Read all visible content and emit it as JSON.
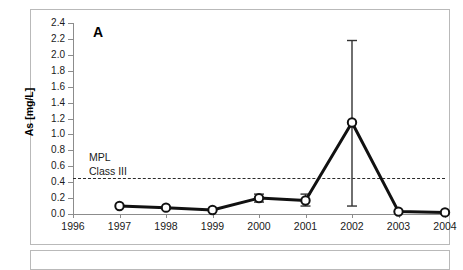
{
  "figure": {
    "panel_label": "A",
    "border_color": "#b9b9b9"
  },
  "annotations": {
    "mpl_line_1": "MPL",
    "mpl_line_2": "Class III",
    "mpl_value": 0.45
  },
  "chart_data": {
    "type": "line",
    "title": "A",
    "xlabel": "",
    "ylabel": "As [mg/L]",
    "xlim": [
      1996,
      2004
    ],
    "ylim": [
      0.0,
      2.4
    ],
    "ytick_step": 0.2,
    "grid": false,
    "legend": false,
    "x_tick_labels": [
      "1996",
      "1997",
      "1998",
      "1999",
      "2000",
      "2001",
      "2002",
      "2003",
      "2004"
    ],
    "y_tick_labels": [
      "0.0",
      "0.2",
      "0.4",
      "0.6",
      "0.8",
      "1.0",
      "1.2",
      "1.4",
      "1.6",
      "1.8",
      "2.0",
      "2.2",
      "2.4"
    ],
    "x": [
      1997,
      1998,
      1999,
      2000,
      2001,
      2002,
      2003,
      2004
    ],
    "values": [
      0.1,
      0.08,
      0.05,
      0.2,
      0.17,
      1.15,
      0.03,
      0.02
    ],
    "error_low": [
      0.0,
      0.0,
      0.0,
      0.05,
      0.07,
      1.05,
      0.0,
      0.0
    ],
    "error_high": [
      0.0,
      0.0,
      0.0,
      0.05,
      0.08,
      1.03,
      0.0,
      0.0
    ],
    "reference_lines": [
      {
        "label": "MPL Class III",
        "y": 0.45,
        "style": "dashed"
      }
    ],
    "marker": "open-circle",
    "series_color": "#111111"
  },
  "axis": {
    "y_title": "As [mg/L]"
  }
}
